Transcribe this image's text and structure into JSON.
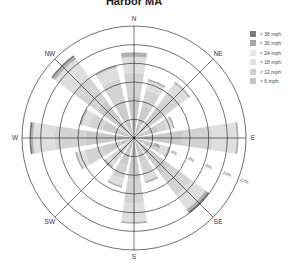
{
  "chart_data": {
    "type": "wind-rose",
    "title": "Harbor MA",
    "directions": [
      "N",
      "NNE",
      "NE",
      "ENE",
      "E",
      "ESE",
      "SE",
      "SSE",
      "S",
      "SSW",
      "SW",
      "WSW",
      "W",
      "WNW",
      "NW",
      "NNW"
    ],
    "direction_labels": [
      "N",
      "NE",
      "E",
      "SE",
      "S",
      "SW",
      "W",
      "NW"
    ],
    "radial_ticks": [
      "2%",
      "4%",
      "6%",
      "8%",
      "10%",
      "12%"
    ],
    "radial_max": 12,
    "speed_bins": [
      "< 6 mph",
      "< 12 mph",
      "< 18 mph",
      "< 24 mph",
      "< 30 mph",
      "< 36 mph"
    ],
    "legend": [
      {
        "label": "< 36 mph",
        "color": "#7a7a7a"
      },
      {
        "label": "< 30 mph",
        "color": "#a6a6a6"
      },
      {
        "label": "< 24 mph",
        "color": "#e8e8e8"
      },
      {
        "label": "< 18 mph",
        "color": "#e2e2e2"
      },
      {
        "label": "< 12 mph",
        "color": "#cfcfcf"
      },
      {
        "label": "< 6 mph",
        "color": "#c6c6c6"
      }
    ],
    "series": [
      {
        "name": "< 6 mph",
        "values": [
          2.0,
          1.5,
          1.8,
          1.2,
          2.2,
          1.0,
          2.0,
          1.2,
          2.0,
          1.2,
          1.0,
          1.5,
          2.2,
          1.5,
          2.2,
          1.8
        ]
      },
      {
        "name": "< 12 mph",
        "values": [
          2.5,
          2.0,
          2.2,
          1.5,
          3.0,
          1.2,
          2.8,
          1.5,
          2.5,
          1.8,
          1.2,
          2.0,
          3.0,
          2.0,
          2.8,
          2.4
        ]
      },
      {
        "name": "< 18 mph",
        "values": [
          2.5,
          1.8,
          2.0,
          1.0,
          3.2,
          0.8,
          2.8,
          1.3,
          2.5,
          1.5,
          1.0,
          2.0,
          3.3,
          1.5,
          3.0,
          2.3
        ]
      },
      {
        "name": "< 24 mph",
        "values": [
          1.7,
          1.0,
          1.3,
          0.6,
          2.6,
          0.8,
          1.9,
          0.8,
          2.0,
          0.8,
          0.6,
          0.8,
          2.3,
          0.8,
          2.5,
          1.3
        ]
      },
      {
        "name": "< 30 mph",
        "values": [
          0.5,
          0.2,
          0.2,
          0.2,
          0.2,
          0.2,
          0.3,
          0.2,
          0.2,
          0.2,
          0.2,
          0.2,
          0.2,
          0.2,
          0.3,
          0.2
        ]
      },
      {
        "name": "< 36 mph",
        "values": [
          0.0,
          0.0,
          0.0,
          0.0,
          0.0,
          0.0,
          0.2,
          0.0,
          0.0,
          0.0,
          0.0,
          0.0,
          0.2,
          0.0,
          0.2,
          0.0
        ]
      }
    ],
    "totals": [
      9.2,
      6.5,
      7.5,
      4.5,
      11.2,
      4.0,
      10.0,
      5.0,
      9.2,
      5.5,
      4.0,
      6.5,
      11.2,
      6.0,
      11.0,
      8.0
    ],
    "grid": true,
    "legend_position": "right"
  }
}
